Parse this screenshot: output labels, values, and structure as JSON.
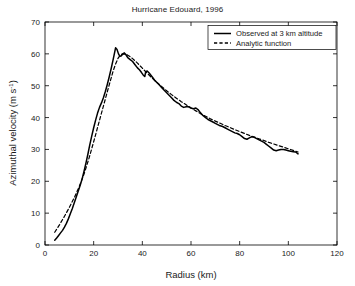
{
  "chart_data": {
    "type": "line",
    "title": "Hurricane Edouard, 1996",
    "xlabel": "Radius (km)",
    "ylabel": "Azimuthal velocity (m s⁻¹)",
    "ylabel_base": "Azimuthal velocity (m s",
    "ylabel_sup": "-1",
    "ylabel_tail": ")",
    "xlim": [
      0,
      120
    ],
    "ylim": [
      0,
      70
    ],
    "xticks": [
      0,
      20,
      40,
      60,
      80,
      100,
      120
    ],
    "yticks": [
      0,
      10,
      20,
      30,
      40,
      50,
      60,
      70
    ],
    "grid": false,
    "legend_position": "top-right",
    "series": [
      {
        "name": "Observed at 3 km altitude",
        "style": "solid",
        "color": "#000000",
        "points": [
          [
            4.0,
            1.5
          ],
          [
            4.8,
            2.2
          ],
          [
            5.6,
            3.0
          ],
          [
            6.4,
            3.8
          ],
          [
            7.2,
            4.6
          ],
          [
            8.0,
            5.6
          ],
          [
            8.8,
            6.8
          ],
          [
            9.6,
            8.2
          ],
          [
            10.4,
            9.8
          ],
          [
            11.2,
            11.4
          ],
          [
            12.0,
            13.2
          ],
          [
            12.8,
            15.0
          ],
          [
            13.6,
            16.8
          ],
          [
            14.4,
            18.6
          ],
          [
            15.2,
            20.6
          ],
          [
            16.0,
            23.0
          ],
          [
            16.8,
            25.6
          ],
          [
            17.6,
            28.4
          ],
          [
            18.4,
            31.4
          ],
          [
            19.2,
            34.2
          ],
          [
            20.0,
            36.8
          ],
          [
            20.8,
            39.2
          ],
          [
            21.6,
            41.4
          ],
          [
            22.4,
            43.2
          ],
          [
            23.2,
            44.6
          ],
          [
            24.0,
            46.2
          ],
          [
            24.8,
            48.2
          ],
          [
            25.6,
            50.4
          ],
          [
            26.4,
            52.8
          ],
          [
            27.2,
            55.4
          ],
          [
            28.0,
            58.2
          ],
          [
            28.6,
            60.4
          ],
          [
            29.0,
            61.9
          ],
          [
            29.6,
            61.4
          ],
          [
            30.2,
            60.0
          ],
          [
            30.8,
            59.2
          ],
          [
            31.4,
            59.4
          ],
          [
            32.0,
            60.0
          ],
          [
            32.6,
            60.3
          ],
          [
            33.2,
            59.8
          ],
          [
            34.0,
            58.8
          ],
          [
            35.0,
            58.2
          ],
          [
            36.0,
            57.6
          ],
          [
            37.0,
            56.6
          ],
          [
            38.0,
            55.6
          ],
          [
            38.8,
            55.0
          ],
          [
            39.6,
            54.2
          ],
          [
            40.4,
            53.3
          ],
          [
            41.0,
            52.9
          ],
          [
            41.4,
            54.4
          ],
          [
            42.0,
            54.6
          ],
          [
            42.8,
            54.0
          ],
          [
            43.6,
            53.2
          ],
          [
            44.4,
            52.4
          ],
          [
            45.2,
            51.6
          ],
          [
            46.0,
            51.0
          ],
          [
            47.0,
            50.2
          ],
          [
            48.0,
            49.4
          ],
          [
            49.0,
            48.6
          ],
          [
            50.0,
            47.8
          ],
          [
            51.0,
            47.0
          ],
          [
            52.0,
            46.2
          ],
          [
            53.0,
            45.4
          ],
          [
            54.0,
            44.8
          ],
          [
            55.0,
            44.4
          ],
          [
            56.0,
            43.6
          ],
          [
            57.0,
            43.2
          ],
          [
            58.0,
            43.4
          ],
          [
            59.0,
            43.4
          ],
          [
            60.0,
            43.0
          ],
          [
            61.0,
            42.8
          ],
          [
            62.0,
            43.0
          ],
          [
            63.0,
            42.4
          ],
          [
            64.0,
            41.4
          ],
          [
            65.0,
            40.6
          ],
          [
            66.0,
            40.0
          ],
          [
            67.0,
            39.4
          ],
          [
            68.0,
            39.0
          ],
          [
            69.0,
            38.6
          ],
          [
            70.0,
            38.2
          ],
          [
            71.0,
            37.8
          ],
          [
            72.0,
            37.4
          ],
          [
            73.0,
            37.2
          ],
          [
            74.0,
            36.8
          ],
          [
            75.0,
            36.4
          ],
          [
            76.0,
            36.0
          ],
          [
            77.0,
            35.6
          ],
          [
            78.0,
            35.2
          ],
          [
            79.0,
            35.0
          ],
          [
            80.0,
            34.6
          ],
          [
            81.0,
            34.0
          ],
          [
            82.0,
            33.4
          ],
          [
            83.0,
            33.2
          ],
          [
            84.0,
            33.6
          ],
          [
            85.0,
            34.0
          ],
          [
            86.0,
            33.8
          ],
          [
            87.0,
            33.4
          ],
          [
            88.0,
            33.0
          ],
          [
            89.0,
            32.6
          ],
          [
            90.0,
            32.2
          ],
          [
            91.0,
            31.6
          ],
          [
            92.0,
            31.0
          ],
          [
            93.0,
            30.4
          ],
          [
            94.0,
            29.8
          ],
          [
            95.0,
            29.6
          ],
          [
            96.0,
            29.8
          ],
          [
            97.0,
            30.0
          ],
          [
            98.0,
            30.0
          ],
          [
            99.0,
            29.8
          ],
          [
            100.0,
            29.6
          ],
          [
            101.0,
            29.4
          ],
          [
            102.0,
            29.3
          ],
          [
            103.0,
            29.2
          ],
          [
            104.0,
            28.6
          ]
        ]
      },
      {
        "name": "Analytic function",
        "style": "dashed",
        "color": "#000000",
        "points": [
          [
            4.0,
            4.0
          ],
          [
            6.0,
            6.4
          ],
          [
            8.0,
            9.0
          ],
          [
            10.0,
            11.8
          ],
          [
            12.0,
            14.8
          ],
          [
            14.0,
            18.2
          ],
          [
            16.0,
            22.2
          ],
          [
            18.0,
            27.0
          ],
          [
            20.0,
            32.4
          ],
          [
            22.0,
            38.0
          ],
          [
            24.0,
            43.6
          ],
          [
            26.0,
            49.2
          ],
          [
            28.0,
            54.6
          ],
          [
            29.0,
            56.8
          ],
          [
            30.0,
            58.6
          ],
          [
            31.0,
            59.7
          ],
          [
            32.0,
            60.0
          ],
          [
            33.0,
            59.9
          ],
          [
            34.0,
            59.6
          ],
          [
            35.0,
            59.1
          ],
          [
            36.0,
            58.5
          ],
          [
            37.0,
            57.8
          ],
          [
            38.0,
            57.1
          ],
          [
            39.0,
            56.3
          ],
          [
            40.0,
            55.5
          ],
          [
            42.0,
            53.9
          ],
          [
            44.0,
            52.4
          ],
          [
            46.0,
            51.0
          ],
          [
            48.0,
            49.7
          ],
          [
            50.0,
            48.4
          ],
          [
            52.0,
            47.2
          ],
          [
            54.0,
            46.1
          ],
          [
            56.0,
            45.0
          ],
          [
            58.0,
            44.0
          ],
          [
            60.0,
            43.0
          ],
          [
            62.0,
            42.1
          ],
          [
            64.0,
            41.2
          ],
          [
            66.0,
            40.4
          ],
          [
            68.0,
            39.6
          ],
          [
            70.0,
            38.9
          ],
          [
            72.0,
            38.2
          ],
          [
            74.0,
            37.5
          ],
          [
            76.0,
            36.9
          ],
          [
            78.0,
            36.2
          ],
          [
            80.0,
            35.6
          ],
          [
            82.0,
            35.0
          ],
          [
            84.0,
            34.4
          ],
          [
            86.0,
            33.9
          ],
          [
            88.0,
            33.3
          ],
          [
            90.0,
            32.8
          ],
          [
            92.0,
            32.2
          ],
          [
            94.0,
            31.7
          ],
          [
            96.0,
            31.2
          ],
          [
            98.0,
            30.7
          ],
          [
            100.0,
            30.2
          ],
          [
            102.0,
            29.7
          ],
          [
            104.0,
            29.2
          ]
        ]
      }
    ]
  },
  "legend": {
    "items": [
      {
        "label": "Observed at 3 km altitude",
        "style": "solid"
      },
      {
        "label": "Analytic function",
        "style": "dashed"
      }
    ]
  }
}
